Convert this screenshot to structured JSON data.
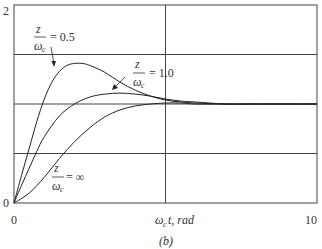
{
  "chart_data": {
    "type": "line",
    "title": "",
    "caption": "(b)",
    "xlabel": "ωct, rad",
    "xlabel_parts": {
      "omega": "ω",
      "sub": "c",
      "rest": "t, rad"
    },
    "ylabel": "",
    "xlim": [
      0,
      10
    ],
    "ylim": [
      0,
      2
    ],
    "x_ticks": [
      "0",
      "10"
    ],
    "y_ticks": [
      "0",
      "2"
    ],
    "grid": true,
    "grid_y": [
      0.5,
      1.0,
      1.5
    ],
    "grid_x": [
      5
    ],
    "legend": "inline annotations",
    "series": [
      {
        "name": "z/ωc = 0.5",
        "label_value": "= 0.5",
        "x": [
          0,
          0.25,
          0.5,
          0.75,
          1,
          1.25,
          1.5,
          1.75,
          2,
          2.25,
          2.5,
          3,
          3.5,
          4,
          4.5,
          5,
          5.5,
          6,
          7,
          8,
          10
        ],
        "values": [
          0,
          0.28,
          0.55,
          0.82,
          1.05,
          1.22,
          1.33,
          1.39,
          1.41,
          1.41,
          1.39,
          1.32,
          1.22,
          1.14,
          1.08,
          1.04,
          1.02,
          1.01,
          1.0,
          1.0,
          1.0
        ]
      },
      {
        "name": "z/ωc = 1.0",
        "label_value": "= 1.0",
        "x": [
          0,
          0.25,
          0.5,
          0.75,
          1,
          1.5,
          2,
          2.5,
          3,
          3.5,
          4,
          4.5,
          5,
          5.5,
          6,
          7,
          8,
          10
        ],
        "values": [
          0,
          0.18,
          0.35,
          0.52,
          0.67,
          0.88,
          1.0,
          1.07,
          1.1,
          1.11,
          1.1,
          1.08,
          1.05,
          1.03,
          1.02,
          1.0,
          1.0,
          1.0
        ]
      },
      {
        "name": "z/ωc = ∞",
        "label_value": "= ∞",
        "x": [
          0,
          0.5,
          1,
          1.5,
          2,
          2.5,
          3,
          3.5,
          4,
          4.5,
          5,
          5.5,
          6,
          7,
          8,
          10
        ],
        "values": [
          0,
          0.1,
          0.26,
          0.45,
          0.62,
          0.76,
          0.87,
          0.94,
          0.98,
          1.0,
          1.01,
          1.01,
          1.0,
          1.0,
          1.0,
          1.0
        ]
      }
    ],
    "annotations": [
      {
        "series": 0,
        "frac_num": "z",
        "frac_den": "ω",
        "frac_den_sub": "c",
        "text": "= 0.5"
      },
      {
        "series": 1,
        "frac_num": "z",
        "frac_den": "ω",
        "frac_den_sub": "c",
        "text": "= 1.0"
      },
      {
        "series": 2,
        "frac_num": "z",
        "frac_den": "ω",
        "frac_den_sub": "c",
        "text": "= ∞"
      }
    ]
  }
}
